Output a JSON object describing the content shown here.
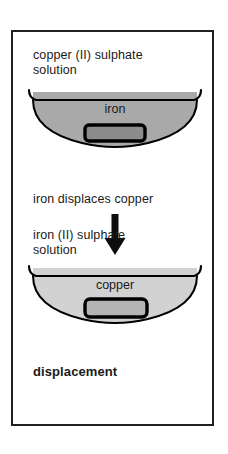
{
  "diagram": {
    "title": "displacement",
    "top_solution_label": "copper (II) sulphate\nsolution",
    "top_metal_label": "iron",
    "reaction_label": "iron displaces copper",
    "bottom_solution_label": "iron (II) sulphate\nsolution",
    "bottom_metal_label": "copper",
    "arrow_direction": "down",
    "colors": {
      "border": "#231f20",
      "ink": "#1a1a1a",
      "top_solution_fill": "#a9a9a9",
      "bottom_solution_fill": "#d2d2d2",
      "top_metal_fill": "#8c8c8c",
      "bottom_metal_fill": "#b4b4b4",
      "outline": "#000000",
      "background": "#ffffff"
    },
    "steps": [
      {
        "solution": "copper (II) sulphate solution",
        "metal": "iron",
        "stage": "before"
      },
      {
        "solution": "iron (II) sulphate solution",
        "metal": "copper",
        "stage": "after"
      }
    ]
  }
}
